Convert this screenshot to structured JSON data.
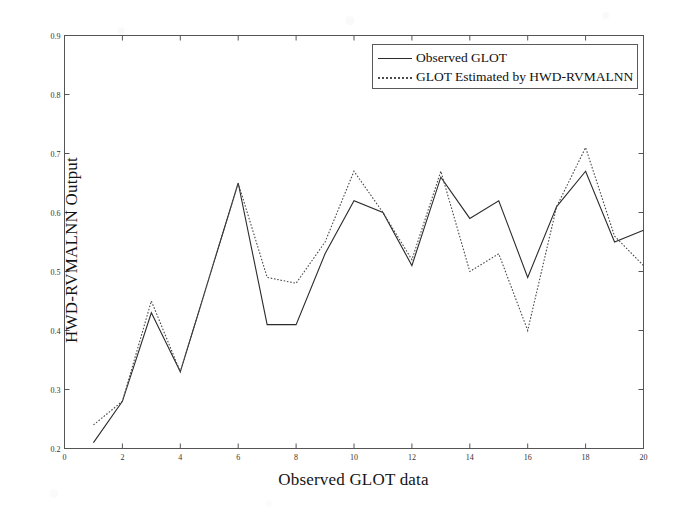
{
  "chart_data": {
    "type": "line",
    "title": "",
    "xlabel": "Observed GLOT data",
    "ylabel": "HWD-RVMALNN Output",
    "x": [
      1,
      2,
      3,
      4,
      5,
      6,
      7,
      8,
      9,
      10,
      11,
      12,
      13,
      14,
      15,
      16,
      17,
      18,
      19,
      20
    ],
    "xlim": [
      0,
      20
    ],
    "ylim": [
      0.2,
      0.9
    ],
    "xticks": [
      0,
      2,
      4,
      6,
      8,
      10,
      12,
      14,
      16,
      18,
      20
    ],
    "yticks": [
      0.2,
      0.3,
      0.4,
      0.5,
      0.6,
      0.7,
      0.8,
      0.9
    ],
    "xtick_labels": [
      "0",
      "2",
      "4",
      "6",
      "8",
      "10",
      "12",
      "14",
      "16",
      "18",
      "20"
    ],
    "ytick_labels": [
      "0.2",
      "0.3",
      "0.4",
      "0.5",
      "0.6",
      "0.7",
      "0.8",
      "0.9"
    ],
    "grid": false,
    "legend_position": "upper right",
    "series": [
      {
        "name": "Observed GLOT",
        "style": "solid",
        "color": "#2b2b2b",
        "values": [
          0.21,
          0.28,
          0.43,
          0.33,
          0.49,
          0.65,
          0.41,
          0.41,
          0.53,
          0.62,
          0.6,
          0.51,
          0.66,
          0.59,
          0.62,
          0.49,
          0.61,
          0.67,
          0.55,
          0.57
        ]
      },
      {
        "name": "GLOT Estimated by HWD-RVMALNN",
        "style": "dotted",
        "color": "#4a4a4a",
        "values": [
          0.24,
          0.28,
          0.45,
          0.33,
          0.49,
          0.65,
          0.49,
          0.48,
          0.55,
          0.67,
          0.6,
          0.52,
          0.67,
          0.5,
          0.53,
          0.4,
          0.61,
          0.71,
          0.56,
          0.51
        ]
      }
    ]
  },
  "legend": {
    "entries": [
      {
        "label": "Observed GLOT"
      },
      {
        "label": "GLOT Estimated by HWD-RVMALNN"
      }
    ]
  },
  "axes": {
    "x_title": "Observed GLOT data",
    "y_title": "HWD-RVMALNN Output"
  },
  "colors": {
    "axis": "#555555",
    "observed": "#2b2b2b",
    "estimated": "#4a4a4a",
    "background": "#ffffff"
  }
}
